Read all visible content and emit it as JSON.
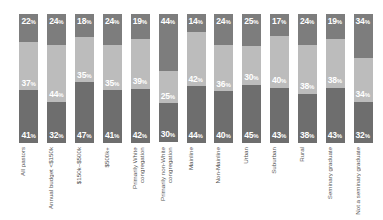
{
  "chart_data": {
    "type": "bar",
    "subtype": "stacked-column-100",
    "title": "",
    "subtitle": "",
    "xlabel": "",
    "ylabel": "",
    "ylim": [
      0,
      100
    ],
    "grid": false,
    "legend_position": "none",
    "categories": [
      "All pastors",
      "Annual budget <$150k",
      "$150k–$500k",
      "$500k+",
      "Primarily White congregation",
      "Primarily non-White congregation",
      "Mainline",
      "Non-Mainline",
      "Urban",
      "Suburban",
      "Rural",
      "Seminary graduate",
      "Not a seminary graduate"
    ],
    "series": [
      {
        "name": "top",
        "color": "#7d7d7d",
        "values": [
          22,
          24,
          18,
          24,
          19,
          44,
          14,
          24,
          25,
          17,
          24,
          19,
          34
        ],
        "labels": [
          "22%",
          "24%",
          "18%",
          "24%",
          "19%",
          "44%",
          "14%",
          "24%",
          "25%",
          "17%",
          "24%",
          "19%",
          "34%"
        ]
      },
      {
        "name": "middle",
        "color": "#bcbcbc",
        "values": [
          37,
          44,
          35,
          35,
          39,
          25,
          42,
          36,
          30,
          40,
          38,
          38,
          34
        ],
        "labels": [
          "37%",
          "44%",
          "35%",
          "35%",
          "39%",
          "25%",
          "42%",
          "36%",
          "30%",
          "40%",
          "38%",
          "38%",
          "34%"
        ]
      },
      {
        "name": "bottom",
        "color": "#6e6e6e",
        "values": [
          41,
          32,
          47,
          41,
          42,
          30,
          44,
          40,
          45,
          43,
          38,
          43,
          32
        ],
        "labels": [
          "41%",
          "32%",
          "47%",
          "41%",
          "42%",
          "30%",
          "44%",
          "40%",
          "45%",
          "43%",
          "38%",
          "43%",
          "32%"
        ]
      }
    ]
  },
  "colors": {
    "background": "#ffffff",
    "segment_top": "#7d7d7d",
    "segment_middle": "#bcbcbc",
    "segment_bottom": "#6e6e6e",
    "value_text": "#ffffff",
    "category_text": "#555555"
  }
}
